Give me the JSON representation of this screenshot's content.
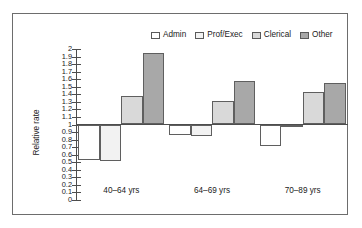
{
  "chart_data": {
    "type": "bar",
    "title": "",
    "subtitle": "",
    "xlabel": "",
    "ylabel": "Relative rate",
    "categories": [
      "40–64 yrs",
      "64–69 yrs",
      "70–89 yrs"
    ],
    "series": [
      {
        "name": "Admin",
        "color": "#ffffff",
        "values": [
          0.53,
          0.86,
          0.72
        ]
      },
      {
        "name": "Prof/Exec",
        "color": "#f2f2f2",
        "values": [
          0.52,
          0.85,
          0.97
        ]
      },
      {
        "name": "Clerical",
        "color": "#d9d9d9",
        "values": [
          1.38,
          1.31,
          1.43
        ]
      },
      {
        "name": "Other",
        "color": "#a8a8a8",
        "values": [
          1.95,
          1.58,
          1.55
        ]
      }
    ],
    "ylim": [
      0,
      2
    ],
    "ytick_step": 0.1,
    "baseline": 1,
    "yticks": [
      "2",
      "1.9",
      "1.8",
      "1.7",
      "1.6",
      "1.5",
      "1.4",
      "1.3",
      "1.2",
      "1.1",
      "1",
      "0.9",
      "0.8",
      "0.7",
      "0.6",
      "0.5",
      "0.4",
      "0.3",
      "0.2",
      "0.1",
      "0"
    ],
    "grid": false,
    "legend_position": "top-right",
    "legend": [
      "Admin",
      "Prof/Exec",
      "Clerical",
      "Other"
    ]
  }
}
